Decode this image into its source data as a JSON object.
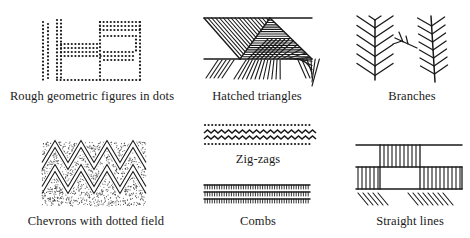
{
  "diagram": {
    "ink_color": "#1a1a1a",
    "background": "#ffffff",
    "motifs": [
      {
        "id": "dots",
        "label": "Rough geometric figures in dots",
        "row": 1,
        "col": 1
      },
      {
        "id": "hatched",
        "label": "Hatched triangles",
        "row": 1,
        "col": 2
      },
      {
        "id": "branches",
        "label": "Branches",
        "row": 1,
        "col": 3
      },
      {
        "id": "chevrons",
        "label": "Chevrons with dotted field",
        "row": 2,
        "col": 1
      },
      {
        "id": "zigzags",
        "label": "Zig-zags",
        "row": 2,
        "col": 2
      },
      {
        "id": "combs",
        "label": "Combs",
        "row": 3,
        "col": 2
      },
      {
        "id": "straight",
        "label": "Straight lines",
        "row": 2,
        "col": 3
      }
    ]
  }
}
